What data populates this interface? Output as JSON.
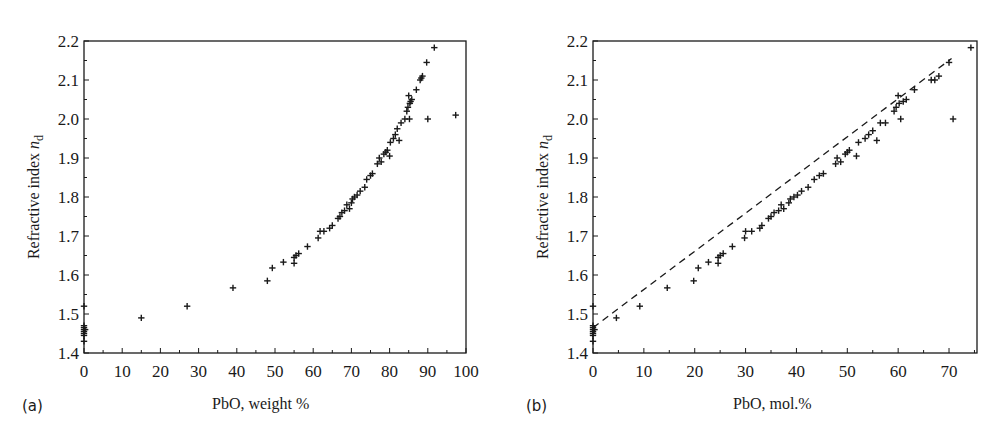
{
  "chart_data": [
    {
      "type": "scatter",
      "panel_label": "(a)",
      "title": "",
      "xlabel": "PbO, weight %",
      "ylabel": "Refractive index n_d",
      "ylabel_main": "Refractive index ",
      "ylabel_var": "n",
      "ylabel_sub": "d",
      "xlim": [
        0,
        100
      ],
      "ylim": [
        1.4,
        2.2
      ],
      "xticks": [
        0,
        10,
        20,
        30,
        40,
        50,
        60,
        70,
        80,
        90,
        100
      ],
      "yticks": [
        1.4,
        1.5,
        1.6,
        1.7,
        1.8,
        1.9,
        2.0,
        2.1,
        2.2
      ],
      "grid": false,
      "marker": "+",
      "series": [
        {
          "name": "PbO glasses",
          "points": [
            [
              0,
              1.52
            ],
            [
              0,
              1.47
            ],
            [
              0,
              1.465
            ],
            [
              0,
              1.46
            ],
            [
              0,
              1.455
            ],
            [
              0,
              1.45
            ],
            [
              0,
              1.445
            ],
            [
              0,
              1.43
            ],
            [
              0.3,
              1.46
            ],
            [
              15,
              1.49
            ],
            [
              27,
              1.52
            ],
            [
              39,
              1.567
            ],
            [
              48,
              1.585
            ],
            [
              49.3,
              1.618
            ],
            [
              52.2,
              1.633
            ],
            [
              55,
              1.63
            ],
            [
              55,
              1.645
            ],
            [
              55.5,
              1.65
            ],
            [
              56.2,
              1.655
            ],
            [
              58.5,
              1.673
            ],
            [
              61.3,
              1.695
            ],
            [
              61.8,
              1.712
            ],
            [
              62.8,
              1.712
            ],
            [
              64.3,
              1.72
            ],
            [
              65,
              1.727
            ],
            [
              66.5,
              1.745
            ],
            [
              67,
              1.75
            ],
            [
              67.5,
              1.76
            ],
            [
              68.2,
              1.765
            ],
            [
              68.8,
              1.78
            ],
            [
              69.5,
              1.77
            ],
            [
              70,
              1.785
            ],
            [
              70.3,
              1.795
            ],
            [
              70.8,
              1.8
            ],
            [
              71.5,
              1.805
            ],
            [
              72.3,
              1.815
            ],
            [
              73.5,
              1.825
            ],
            [
              74,
              1.845
            ],
            [
              75,
              1.855
            ],
            [
              75.5,
              1.86
            ],
            [
              76.8,
              1.885
            ],
            [
              77.3,
              1.9
            ],
            [
              77.8,
              1.89
            ],
            [
              78.5,
              1.91
            ],
            [
              79,
              1.915
            ],
            [
              79.4,
              1.92
            ],
            [
              80,
              1.905
            ],
            [
              80.2,
              1.94
            ],
            [
              81,
              1.95
            ],
            [
              81.5,
              1.96
            ],
            [
              82,
              1.975
            ],
            [
              82.5,
              1.945
            ],
            [
              83,
              1.99
            ],
            [
              84,
              2.0
            ],
            [
              84.5,
              2.02
            ],
            [
              84.8,
              2.03
            ],
            [
              85,
              2.06
            ],
            [
              85.3,
              2.04
            ],
            [
              85.5,
              2.045
            ],
            [
              85.8,
              2.05
            ],
            [
              85.2,
              2.0
            ],
            [
              87,
              2.075
            ],
            [
              88,
              2.1
            ],
            [
              88.3,
              2.105
            ],
            [
              88.6,
              2.11
            ],
            [
              89.7,
              2.145
            ],
            [
              90,
              2.0
            ],
            [
              91.7,
              2.183
            ],
            [
              97.3,
              2.01
            ]
          ]
        }
      ]
    },
    {
      "type": "scatter",
      "panel_label": "(b)",
      "title": "",
      "xlabel": "PbO, mol.%",
      "ylabel": "Refractive index n_d",
      "ylabel_main": "Refractive index ",
      "ylabel_var": "n",
      "ylabel_sub": "d",
      "xlim": [
        0,
        75.5
      ],
      "ylim": [
        1.4,
        2.2
      ],
      "xticks": [
        0,
        10,
        20,
        30,
        40,
        50,
        60,
        70
      ],
      "yticks": [
        1.4,
        1.5,
        1.6,
        1.7,
        1.8,
        1.9,
        2.0,
        2.1,
        2.2
      ],
      "grid": false,
      "marker": "+",
      "series": [
        {
          "name": "PbO glasses",
          "points": [
            [
              0,
              1.52
            ],
            [
              0,
              1.47
            ],
            [
              0,
              1.465
            ],
            [
              0,
              1.46
            ],
            [
              0,
              1.455
            ],
            [
              0,
              1.45
            ],
            [
              0,
              1.445
            ],
            [
              0,
              1.43
            ],
            [
              0.3,
              1.46
            ],
            [
              4.6,
              1.49
            ],
            [
              9.2,
              1.52
            ],
            [
              14.6,
              1.567
            ],
            [
              19.8,
              1.585
            ],
            [
              20.7,
              1.618
            ],
            [
              22.7,
              1.633
            ],
            [
              24.6,
              1.63
            ],
            [
              24.6,
              1.645
            ],
            [
              25,
              1.65
            ],
            [
              25.6,
              1.655
            ],
            [
              27.4,
              1.673
            ],
            [
              29.8,
              1.695
            ],
            [
              30,
              1.712
            ],
            [
              31.2,
              1.712
            ],
            [
              32.8,
              1.72
            ],
            [
              33.2,
              1.727
            ],
            [
              34.5,
              1.745
            ],
            [
              35,
              1.75
            ],
            [
              35.6,
              1.76
            ],
            [
              36.5,
              1.765
            ],
            [
              37,
              1.78
            ],
            [
              37.5,
              1.77
            ],
            [
              38.5,
              1.785
            ],
            [
              38.8,
              1.795
            ],
            [
              39.5,
              1.8
            ],
            [
              40.2,
              1.805
            ],
            [
              41,
              1.815
            ],
            [
              42.3,
              1.825
            ],
            [
              43.5,
              1.845
            ],
            [
              44.5,
              1.855
            ],
            [
              45.3,
              1.86
            ],
            [
              47.7,
              1.885
            ],
            [
              48,
              1.9
            ],
            [
              48.7,
              1.89
            ],
            [
              49.6,
              1.91
            ],
            [
              50,
              1.915
            ],
            [
              50.4,
              1.92
            ],
            [
              51.8,
              1.905
            ],
            [
              52.2,
              1.94
            ],
            [
              53.5,
              1.95
            ],
            [
              54.2,
              1.96
            ],
            [
              55,
              1.97
            ],
            [
              55.8,
              1.945
            ],
            [
              56.5,
              1.99
            ],
            [
              57.5,
              1.99
            ],
            [
              59.2,
              2.02
            ],
            [
              59.6,
              2.03
            ],
            [
              60,
              2.06
            ],
            [
              60.2,
              2.04
            ],
            [
              61,
              2.045
            ],
            [
              61.6,
              2.05
            ],
            [
              60.5,
              2.0
            ],
            [
              63.2,
              2.075
            ],
            [
              66.5,
              2.1
            ],
            [
              67.2,
              2.1
            ],
            [
              68,
              2.11
            ],
            [
              70,
              2.145
            ],
            [
              70.8,
              2.0
            ],
            [
              74.3,
              2.183
            ]
          ]
        }
      ],
      "trend_line": {
        "style": "dashed",
        "from": [
          0,
          1.465
        ],
        "to": [
          70.5,
          2.155
        ]
      }
    }
  ]
}
